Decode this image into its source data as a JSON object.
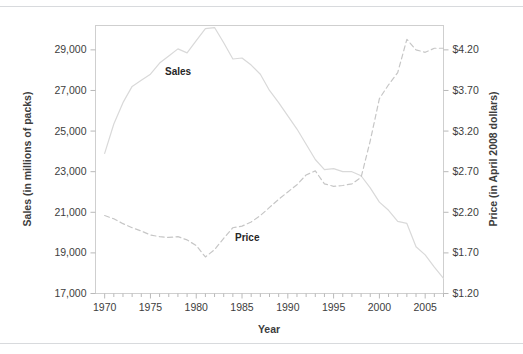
{
  "figure": {
    "background": "#ffffff",
    "separator_color": "#d8dadd",
    "frame_color": "#cfcfcf"
  },
  "labels": {
    "y_left_title": "Sales (in millions of packs)",
    "y_right_title": "Price (in April 2008 dollars)",
    "x_title": "Year",
    "series_sales": "Sales",
    "series_price": "Price"
  },
  "chart_data": {
    "type": "line",
    "title": "",
    "subtitle": "",
    "xlabel": "Year",
    "ylabel": "Sales (in millions of packs)",
    "y2label": "Price (in April 2008 dollars)",
    "grid": false,
    "legend": "inline-annotations",
    "xlim": [
      1969,
      2007
    ],
    "ylim": [
      17000,
      30200
    ],
    "y2lim": [
      1.2,
      4.5
    ],
    "xticks": [
      1970,
      1971,
      1972,
      1973,
      1974,
      1975,
      1976,
      1977,
      1978,
      1979,
      1980,
      1981,
      1982,
      1983,
      1984,
      1985,
      1986,
      1987,
      1988,
      1989,
      1990,
      1991,
      1992,
      1993,
      1994,
      1995,
      1996,
      1997,
      1998,
      1999,
      2000,
      2001,
      2002,
      2003,
      2004,
      2005,
      2006,
      2007
    ],
    "xtick_labels": [
      "1970",
      "1975",
      "1980",
      "1985",
      "1990",
      "1995",
      "2000",
      "2005"
    ],
    "xtick_label_values": [
      1970,
      1975,
      1980,
      1985,
      1990,
      1995,
      2000,
      2005
    ],
    "yticks_left": [
      17000,
      19000,
      21000,
      23000,
      25000,
      27000,
      29000
    ],
    "ytick_labels_left": [
      "17,000",
      "19,000",
      "21,000",
      "23,000",
      "25,000",
      "27,000",
      "29,000"
    ],
    "yticks_right": [
      1.2,
      1.7,
      2.2,
      2.7,
      3.2,
      3.7,
      4.2
    ],
    "ytick_labels_right": [
      "$1.20",
      "$1.70",
      "$2.20",
      "$2.70",
      "$3.20",
      "$3.70",
      "$4.20"
    ],
    "x": [
      1970,
      1971,
      1972,
      1973,
      1974,
      1975,
      1976,
      1977,
      1978,
      1979,
      1980,
      1981,
      1982,
      1983,
      1984,
      1985,
      1986,
      1987,
      1988,
      1989,
      1990,
      1991,
      1992,
      1993,
      1994,
      1995,
      1996,
      1997,
      1998,
      1999,
      2000,
      2001,
      2002,
      2003,
      2004,
      2005,
      2006,
      2007
    ],
    "series": [
      {
        "name": "Sales",
        "axis": "left",
        "style": "solid",
        "color": "#d9d9d9",
        "units": "millions of packs",
        "values": [
          23900,
          25350,
          26400,
          27200,
          27500,
          27800,
          28350,
          28700,
          29050,
          28850,
          29450,
          30050,
          30100,
          29350,
          28550,
          28600,
          28250,
          27800,
          27000,
          26400,
          25750,
          25100,
          24350,
          23600,
          23100,
          23150,
          23000,
          23000,
          22800,
          22200,
          21500,
          21100,
          20550,
          20450,
          19300,
          18900,
          18300,
          17750
        ]
      },
      {
        "name": "Price",
        "axis": "right",
        "style": "dashed",
        "color": "#c6c6c6",
        "units": "April 2008 dollars",
        "values": [
          2.16,
          2.12,
          2.06,
          2.01,
          1.97,
          1.92,
          1.9,
          1.89,
          1.9,
          1.86,
          1.79,
          1.65,
          1.74,
          1.88,
          2.01,
          2.03,
          2.08,
          2.16,
          2.26,
          2.36,
          2.45,
          2.54,
          2.66,
          2.71,
          2.55,
          2.52,
          2.53,
          2.55,
          2.63,
          3.08,
          3.6,
          3.77,
          3.92,
          4.33,
          4.2,
          4.17,
          4.22,
          4.22
        ]
      }
    ]
  }
}
